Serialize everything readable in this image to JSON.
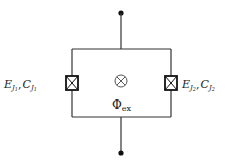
{
  "diagram": {
    "type": "circuit",
    "junction_left": {
      "label_E": "E",
      "label_E_sub": "J",
      "label_E_subsub": "1",
      "sep": ",",
      "label_C": "C",
      "label_C_sub": "J",
      "label_C_subsub": "1"
    },
    "junction_right": {
      "label_E": "E",
      "label_E_sub": "J",
      "label_E_subsub": "2",
      "sep": ",",
      "label_C": "C",
      "label_C_sub": "J",
      "label_C_subsub": "2"
    },
    "flux": {
      "symbol": "Φ",
      "subscript": "ex"
    },
    "colors": {
      "line": "#222222",
      "background": "#ffffff"
    }
  }
}
